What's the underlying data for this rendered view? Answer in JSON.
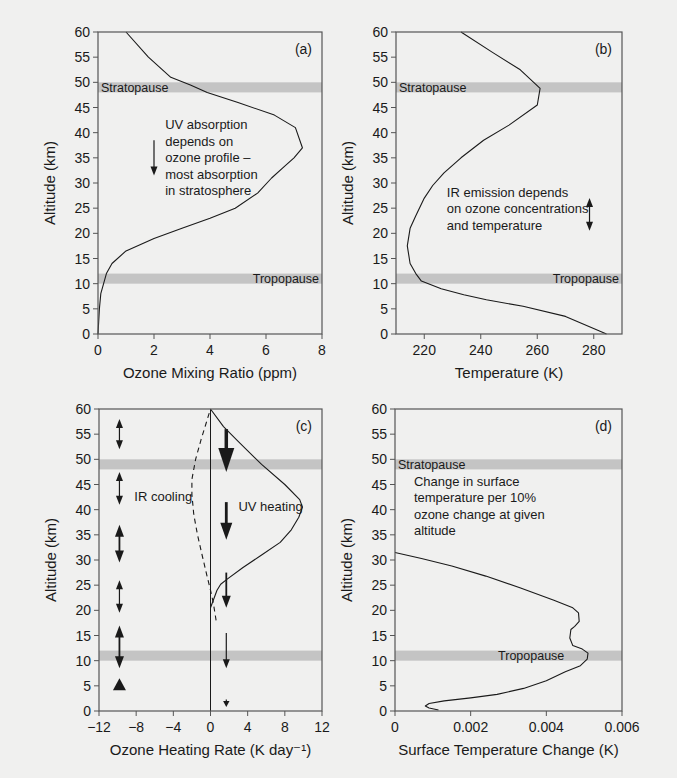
{
  "figure": {
    "colors": {
      "background": "#f0f0ef",
      "band": "#c4c4c4",
      "line": "#1a1a1a",
      "axis": "#555555"
    }
  },
  "chart_data": [
    {
      "id": "a",
      "type": "line",
      "panel_label": "(a)",
      "title": "",
      "xlabel": "Ozone Mixing Ratio (ppm)",
      "ylabel": "Altitude (km)",
      "xlim": [
        0,
        8
      ],
      "ylim": [
        0,
        60
      ],
      "xticks": [
        0,
        2,
        4,
        6,
        8
      ],
      "xtick_labels": [
        "0",
        "2",
        "4",
        "6",
        "8"
      ],
      "yticks": [
        0,
        5,
        10,
        15,
        20,
        25,
        30,
        35,
        40,
        45,
        50,
        55,
        60
      ],
      "ytick_labels": [
        "0",
        "5",
        "10",
        "15",
        "20",
        "25",
        "30",
        "35",
        "40",
        "45",
        "50",
        "55",
        "60"
      ],
      "grid": false,
      "bands": [
        {
          "name": "Stratopause",
          "from": 48,
          "to": 50,
          "label": "Stratopause",
          "label_align": "left"
        },
        {
          "name": "Tropopause",
          "from": 10,
          "to": 12,
          "label": "Tropopause",
          "label_align": "right"
        }
      ],
      "series": [
        {
          "name": "ozone-profile",
          "style": "solid",
          "points": [
            [
              0.0,
              0
            ],
            [
              0.05,
              5
            ],
            [
              0.1,
              8
            ],
            [
              0.2,
              10
            ],
            [
              0.3,
              12
            ],
            [
              0.5,
              14
            ],
            [
              1.0,
              16.5
            ],
            [
              2.0,
              19
            ],
            [
              3.0,
              21
            ],
            [
              4.0,
              23
            ],
            [
              4.9,
              25
            ],
            [
              5.7,
              28
            ],
            [
              6.2,
              31
            ],
            [
              6.6,
              33
            ],
            [
              7.0,
              35
            ],
            [
              7.3,
              37
            ],
            [
              7.05,
              41
            ],
            [
              6.3,
              43.5
            ],
            [
              5.0,
              46
            ],
            [
              3.9,
              48
            ],
            [
              3.3,
              49.5
            ],
            [
              2.6,
              51
            ],
            [
              1.8,
              55
            ],
            [
              1.0,
              60
            ]
          ]
        }
      ],
      "annotations": [
        {
          "lines": [
            "UV absorption",
            "depends on",
            "ozone profile –",
            "most absorption",
            "in stratosphere"
          ],
          "x": 2.4,
          "y": 40.7
        },
        {
          "type": "arrow",
          "direction": "down",
          "x": 2.0,
          "y_from": 38.5,
          "y_to": 31.5,
          "weight": "thin"
        }
      ]
    },
    {
      "id": "b",
      "type": "line",
      "panel_label": "(b)",
      "title": "",
      "xlabel": "Temperature (K)",
      "ylabel": "Altitude (km)",
      "xlim": [
        210,
        290
      ],
      "ylim": [
        0,
        60
      ],
      "xticks": [
        220,
        240,
        260,
        280
      ],
      "xtick_labels": [
        "220",
        "240",
        "260",
        "280"
      ],
      "yticks": [
        0,
        5,
        10,
        15,
        20,
        25,
        30,
        35,
        40,
        45,
        50,
        55,
        60
      ],
      "ytick_labels": [
        "0",
        "5",
        "10",
        "15",
        "20",
        "25",
        "30",
        "35",
        "40",
        "45",
        "50",
        "55",
        "60"
      ],
      "grid": false,
      "bands": [
        {
          "name": "Stratopause",
          "from": 48,
          "to": 50,
          "label": "Stratopause",
          "label_align": "left"
        },
        {
          "name": "Tropopause",
          "from": 10,
          "to": 12,
          "label": "Tropopause",
          "label_align": "right"
        }
      ],
      "series": [
        {
          "name": "temperature-profile",
          "style": "solid",
          "points": [
            [
              284.5,
              0
            ],
            [
              270,
              3.5
            ],
            [
              255,
              5.5
            ],
            [
              242,
              6.8
            ],
            [
              234,
              7.8
            ],
            [
              226,
              9
            ],
            [
              219,
              10.5
            ],
            [
              217,
              12
            ],
            [
              215,
              14
            ],
            [
              214,
              17.5
            ],
            [
              215,
              21
            ],
            [
              217,
              23.5
            ],
            [
              220,
              27
            ],
            [
              223,
              29.5
            ],
            [
              227,
              32
            ],
            [
              233,
              35
            ],
            [
              241,
              38.5
            ],
            [
              250,
              41.5
            ],
            [
              260,
              45.5
            ],
            [
              261,
              48.8
            ],
            [
              254,
              52.5
            ],
            [
              244,
              56
            ],
            [
              233,
              60
            ]
          ]
        }
      ],
      "annotations": [
        {
          "lines": [
            "IR emission depends",
            "on ozone concentrations",
            "and temperature"
          ],
          "x": 228,
          "y": 27.3
        },
        {
          "type": "arrow",
          "direction": "both",
          "x": 278.5,
          "y_from": 27,
          "y_to": 20.5,
          "weight": "thin"
        }
      ]
    },
    {
      "id": "c",
      "type": "line",
      "panel_label": "(c)",
      "title": "",
      "xlabel": "Ozone Heating Rate (K day⁻¹)",
      "ylabel": "Altitude (km)",
      "xlim": [
        -12,
        12
      ],
      "ylim": [
        0,
        60
      ],
      "xticks": [
        -12,
        -8,
        -4,
        0,
        4,
        8,
        12
      ],
      "xtick_labels": [
        "−12",
        "−8",
        "−4",
        "0",
        "4",
        "8",
        "12"
      ],
      "yticks": [
        0,
        5,
        10,
        15,
        20,
        25,
        30,
        35,
        40,
        45,
        50,
        55,
        60
      ],
      "ytick_labels": [
        "0",
        "5",
        "10",
        "15",
        "20",
        "25",
        "30",
        "35",
        "40",
        "45",
        "50",
        "55",
        "60"
      ],
      "grid": false,
      "zero_line": 0,
      "bands": [
        {
          "name": "Stratopause",
          "from": 48,
          "to": 50,
          "label": "",
          "label_align": "left"
        },
        {
          "name": "Tropopause",
          "from": 10,
          "to": 12,
          "label": "",
          "label_align": "right"
        }
      ],
      "series": [
        {
          "name": "UV heating",
          "style": "solid",
          "points": [
            [
              0,
              20.5
            ],
            [
              0.3,
              22
            ],
            [
              0.7,
              24
            ],
            [
              1.1,
              25.2
            ],
            [
              1.8,
              26.2
            ],
            [
              3.5,
              28.5
            ],
            [
              5.5,
              31
            ],
            [
              7.5,
              33.5
            ],
            [
              8.7,
              36
            ],
            [
              9.5,
              38.5
            ],
            [
              9.9,
              40.5
            ],
            [
              9.6,
              42
            ],
            [
              8.0,
              45
            ],
            [
              5.5,
              49
            ],
            [
              3.0,
              53.5
            ],
            [
              1.4,
              56.5
            ],
            [
              0,
              60
            ]
          ]
        },
        {
          "name": "IR cooling",
          "style": "dashed",
          "points": [
            [
              0.6,
              18
            ],
            [
              0.3,
              21.5
            ],
            [
              0.0,
              24
            ],
            [
              -0.4,
              27
            ],
            [
              -0.9,
              31
            ],
            [
              -1.4,
              35
            ],
            [
              -1.8,
              39
            ],
            [
              -2.0,
              43
            ],
            [
              -2.0,
              46
            ],
            [
              -1.6,
              50
            ],
            [
              -1.0,
              54
            ],
            [
              0,
              60
            ]
          ]
        }
      ],
      "annotations": [
        {
          "lines": [
            "IR cooling"
          ],
          "x": -8.2,
          "y": 41.8
        },
        {
          "lines": [
            "UV heating"
          ],
          "x": 3.0,
          "y": 39.8
        },
        {
          "type": "arrow",
          "direction": "both",
          "x": -9.8,
          "y_from": 58,
          "y_to": 52,
          "weight": "thin"
        },
        {
          "type": "arrow",
          "direction": "both",
          "x": -9.8,
          "y_from": 47.5,
          "y_to": 41,
          "weight": "thin"
        },
        {
          "type": "arrow",
          "direction": "both",
          "x": -9.8,
          "y_from": 37,
          "y_to": 29.5,
          "weight": "medium"
        },
        {
          "type": "arrow",
          "direction": "both",
          "x": -9.8,
          "y_from": 26,
          "y_to": 19.5,
          "weight": "thin"
        },
        {
          "type": "arrow",
          "direction": "both",
          "x": -9.8,
          "y_from": 17,
          "y_to": 8.5,
          "weight": "medium"
        },
        {
          "type": "arrow",
          "direction": "up",
          "x": -9.8,
          "y_from": 3,
          "y_to": 6.5,
          "weight": "heavy-head"
        },
        {
          "type": "arrow",
          "direction": "down",
          "x": 1.7,
          "y_from": 56,
          "y_to": 47.5,
          "weight": "heavy"
        },
        {
          "type": "arrow",
          "direction": "down",
          "x": 1.7,
          "y_from": 41.5,
          "y_to": 34,
          "weight": "medium-heavy"
        },
        {
          "type": "arrow",
          "direction": "down",
          "x": 1.7,
          "y_from": 27.5,
          "y_to": 20.5,
          "weight": "medium"
        },
        {
          "type": "arrow",
          "direction": "down",
          "x": 1.7,
          "y_from": 15.5,
          "y_to": 8.5,
          "weight": "thin"
        },
        {
          "type": "arrow",
          "direction": "down",
          "x": 1.7,
          "y_from": 2.3,
          "y_to": 0.8,
          "weight": "tiny"
        }
      ]
    },
    {
      "id": "d",
      "type": "line",
      "panel_label": "(d)",
      "title": "",
      "xlabel": "Surface Temperature Change (K)",
      "ylabel": "Altitude (km)",
      "xlim": [
        0,
        0.006
      ],
      "ylim": [
        0,
        60
      ],
      "xticks": [
        0,
        0.002,
        0.004,
        0.006
      ],
      "xtick_labels": [
        "0",
        "0.002",
        "0.004",
        "0.006"
      ],
      "yticks": [
        0,
        5,
        10,
        15,
        20,
        25,
        30,
        35,
        40,
        45,
        50,
        55,
        60
      ],
      "ytick_labels": [
        "0",
        "5",
        "10",
        "15",
        "20",
        "25",
        "30",
        "35",
        "40",
        "45",
        "50",
        "55",
        "60"
      ],
      "grid": false,
      "bands": [
        {
          "name": "Stratopause",
          "from": 48,
          "to": 50,
          "label": "Stratopause",
          "label_align": "left"
        },
        {
          "name": "Tropopause",
          "from": 10,
          "to": 12,
          "label": "Tropopause",
          "label_align": "center"
        }
      ],
      "series": [
        {
          "name": "surface-temperature-change",
          "style": "solid",
          "points": [
            [
              0.00115,
              0.2
            ],
            [
              0.0009,
              0.6
            ],
            [
              0.0008,
              1.0
            ],
            [
              0.0009,
              1.5
            ],
            [
              0.0013,
              2.0
            ],
            [
              0.002,
              2.6
            ],
            [
              0.0027,
              3.3
            ],
            [
              0.0034,
              4.5
            ],
            [
              0.004,
              6.0
            ],
            [
              0.0045,
              7.8
            ],
            [
              0.0049,
              9.0
            ],
            [
              0.00508,
              10.3
            ],
            [
              0.0051,
              11.5
            ],
            [
              0.00495,
              12.3
            ],
            [
              0.0047,
              13.0
            ],
            [
              0.00462,
              14.5
            ],
            [
              0.00465,
              16.2
            ],
            [
              0.00475,
              16.8
            ],
            [
              0.00487,
              17.8
            ],
            [
              0.00485,
              19.5
            ],
            [
              0.0047,
              20.5
            ],
            [
              0.0042,
              22
            ],
            [
              0.0033,
              24.5
            ],
            [
              0.0024,
              26.8
            ],
            [
              0.0015,
              28.8
            ],
            [
              0.0007,
              30.3
            ],
            [
              0.0,
              31.5
            ]
          ]
        }
      ],
      "annotations": [
        {
          "lines": [
            "Change in surface",
            "temperature per 10%",
            "ozone change at given",
            "altitude"
          ],
          "x": 0.0005,
          "y": 44.8
        }
      ]
    }
  ]
}
